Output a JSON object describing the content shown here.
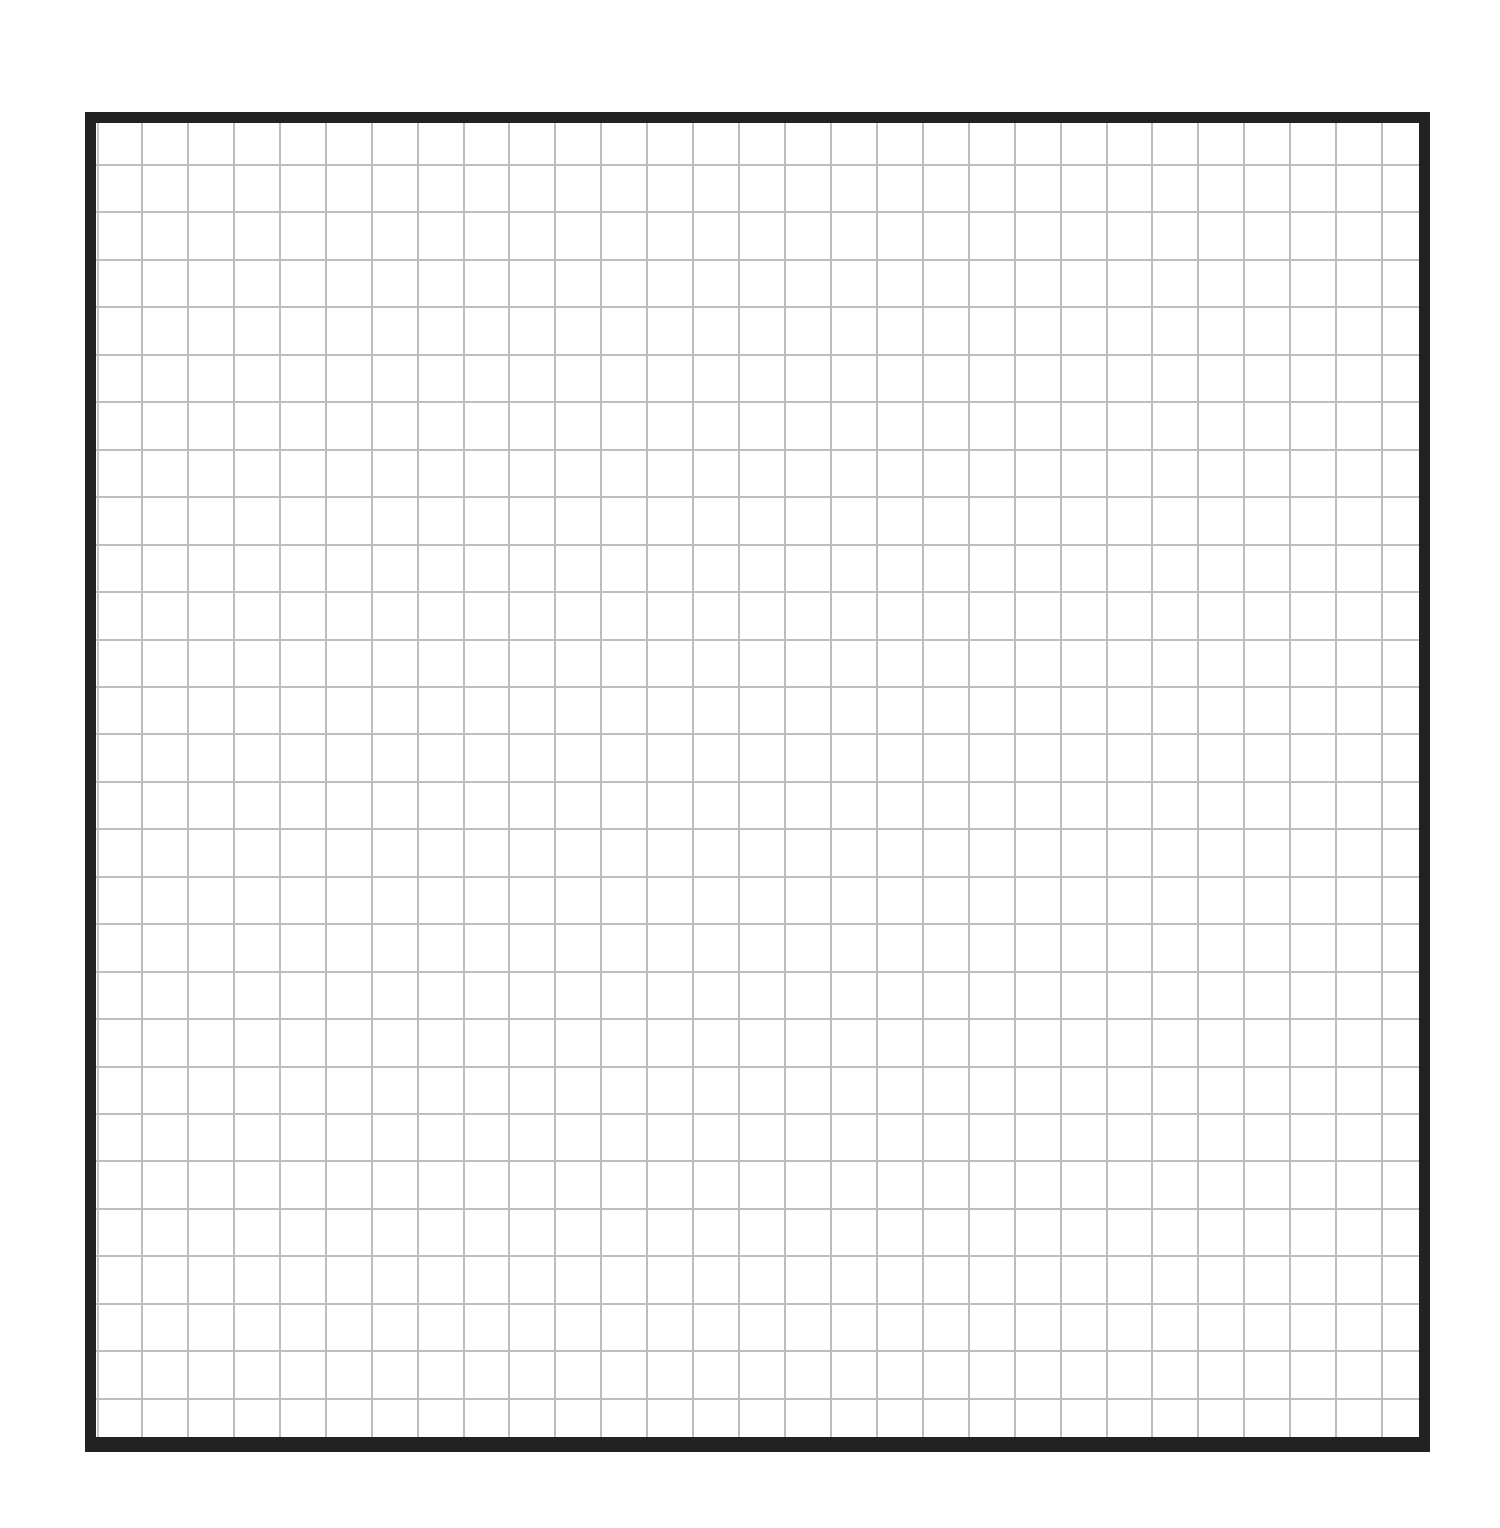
{
  "sheet": {
    "background": "#ffffff",
    "description": "Blank square-grid graph paper"
  },
  "frame": {
    "left": 85,
    "top": 112,
    "right": 1430,
    "bottom": 1452,
    "border_color": "#222222",
    "border_width": 11
  },
  "grid": {
    "line_color": "#bdbdbd",
    "line_width": 2,
    "inner_left_line_x": 97,
    "interior": {
      "left": 96,
      "top": 123,
      "right": 1419,
      "bottom": 1437
    },
    "vertical": {
      "first_x": 141,
      "spacing": 45.93,
      "count": 28
    },
    "horizontal": {
      "first_y": 164,
      "spacing": 47.45,
      "count": 27
    }
  }
}
